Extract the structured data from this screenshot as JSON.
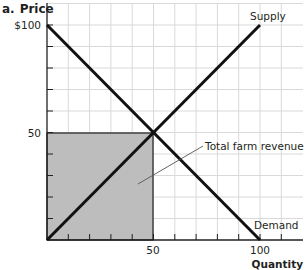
{
  "panel_label": "a.",
  "colors": {
    "grid": "#d9d9d9",
    "axis": "#231f20",
    "curve": "#111111",
    "shade": "#bdbdbd",
    "leader": "#555555"
  },
  "chart_data": {
    "type": "line",
    "xlabel": "Quantity",
    "ylabel": "Price",
    "xlim": [
      0,
      120
    ],
    "ylim": [
      0,
      110
    ],
    "grid": true,
    "x_ticks": [
      0,
      10,
      20,
      30,
      40,
      50,
      60,
      70,
      80,
      90,
      100,
      110
    ],
    "y_ticks": [
      0,
      10,
      20,
      30,
      40,
      50,
      60,
      70,
      80,
      90,
      100
    ],
    "x_tick_labels": [
      {
        "value": 50,
        "label": "50"
      },
      {
        "value": 100,
        "label": "100"
      }
    ],
    "y_tick_labels": [
      {
        "value": 50,
        "label": "50"
      },
      {
        "value": 100,
        "label": "$100"
      }
    ],
    "series": [
      {
        "name": "Supply",
        "x": [
          0,
          100
        ],
        "y": [
          0,
          100
        ]
      },
      {
        "name": "Demand",
        "x": [
          0,
          100
        ],
        "y": [
          100,
          0
        ]
      }
    ],
    "equilibrium": {
      "quantity": 50,
      "price": 50
    },
    "shaded_region": {
      "name": "Total farm revenue",
      "x": [
        0,
        50
      ],
      "y": [
        0,
        50
      ],
      "value": 2500
    },
    "annotations": [
      {
        "text": "Supply",
        "x": 100,
        "y": 100
      },
      {
        "text": "Demand",
        "x": 100,
        "y": 0
      },
      {
        "text": "Total farm revenue",
        "x": 70,
        "y": 40,
        "points_to": [
          30,
          30
        ]
      }
    ]
  },
  "labels": {
    "title_prefix": "a.",
    "y_axis": "Price",
    "x_axis": "Quantity",
    "y100": "$100",
    "y50": "50",
    "x50": "50",
    "x100": "100",
    "supply": "Supply",
    "demand": "Demand",
    "revenue": "Total farm revenue"
  }
}
